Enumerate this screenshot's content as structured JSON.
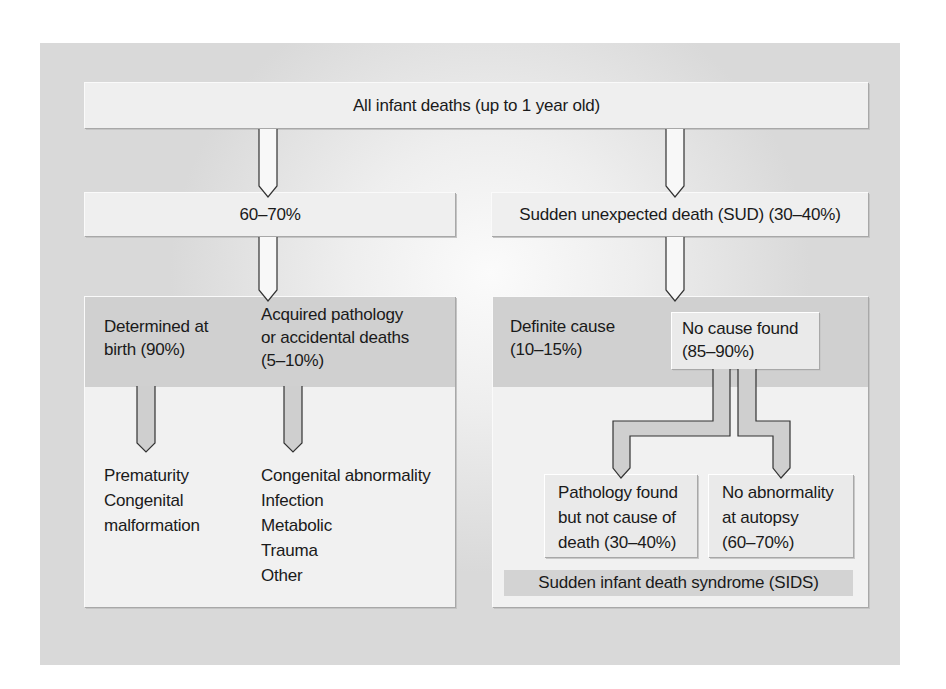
{
  "diagram": {
    "type": "flowchart",
    "root": {
      "label": "All infant deaths (up to 1 year old)"
    },
    "left_branch": {
      "label": "60–70%",
      "categories": [
        {
          "label_line1": "Determined at",
          "label_line2": "birth (90%)",
          "items": [
            "Prematurity",
            "Congenital",
            "malformation"
          ]
        },
        {
          "label_line1": "Acquired pathology",
          "label_line2": "or accidental deaths",
          "label_line3": "(5–10%)",
          "items": [
            "Congenital abnormality",
            "Infection",
            "Metabolic",
            "Trauma",
            "Other"
          ]
        }
      ]
    },
    "right_branch": {
      "label": "Sudden unexpected death (SUD) (30–40%)",
      "definite_cause": {
        "line1": "Definite cause",
        "line2": "(10–15%)"
      },
      "no_cause": {
        "line1": "No cause found",
        "line2": "(85–90%)"
      },
      "outcomes": [
        {
          "line1": "Pathology found",
          "line2": "but not cause of",
          "line3": "death (30–40%)"
        },
        {
          "line1": "No abnormality",
          "line2": "at autopsy",
          "line3": "(60–70%)"
        }
      ],
      "sids_label": "Sudden infant death syndrome (SIDS)"
    },
    "colors": {
      "panel": "#d9d9d9",
      "box": "#efefef",
      "band": "#d0d0d0",
      "arrow_fill_white": "#f8f8f8",
      "arrow_fill_gray": "#cfcfcf",
      "arrow_stroke": "#333333"
    }
  }
}
